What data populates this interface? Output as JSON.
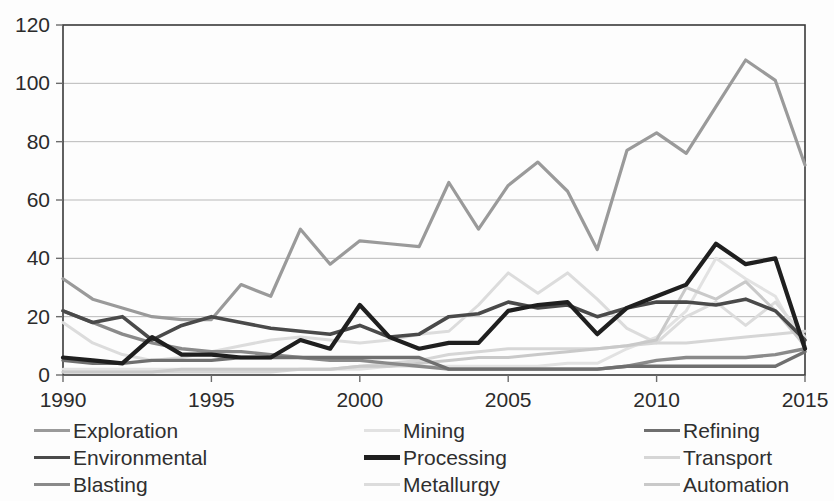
{
  "chart_data": {
    "type": "line",
    "title": "",
    "xlabel": "",
    "ylabel": "",
    "x": [
      1990,
      1991,
      1992,
      1993,
      1994,
      1995,
      1996,
      1997,
      1998,
      1999,
      2000,
      2001,
      2002,
      2003,
      2004,
      2005,
      2006,
      2007,
      2008,
      2009,
      2010,
      2011,
      2012,
      2013,
      2014,
      2015
    ],
    "xlim": [
      1990,
      2015
    ],
    "ylim": [
      0,
      120
    ],
    "xticks": [
      1990,
      1995,
      2000,
      2005,
      2010,
      2015
    ],
    "yticks": [
      0,
      20,
      40,
      60,
      80,
      100,
      120
    ],
    "grid": "horizontal",
    "legend_position": "bottom",
    "legend_columns": 3,
    "series": [
      {
        "name": "Exploration",
        "color": "#9a9a9a",
        "width": 3.2,
        "values": [
          33,
          26,
          23,
          20,
          19,
          19,
          31,
          27,
          50,
          38,
          46,
          45,
          44,
          66,
          50,
          65,
          73,
          63,
          43,
          77,
          83,
          76,
          92,
          108,
          101,
          72
        ]
      },
      {
        "name": "Mining",
        "color": "#e2e2e2",
        "width": 3.0,
        "values": [
          2,
          2,
          2,
          2,
          2,
          2,
          2,
          2,
          2,
          2,
          2,
          3,
          3,
          3,
          3,
          3,
          3,
          4,
          4,
          9,
          13,
          22,
          40,
          33,
          27,
          9
        ]
      },
      {
        "name": "Refining",
        "color": "#6f6f6f",
        "width": 3.4,
        "values": [
          5,
          4,
          4,
          5,
          5,
          5,
          6,
          6,
          6,
          6,
          6,
          6,
          6,
          2,
          2,
          2,
          2,
          2,
          2,
          3,
          3,
          3,
          3,
          3,
          3,
          8
        ]
      },
      {
        "name": "Environmental",
        "color": "#4a4a4a",
        "width": 3.6,
        "values": [
          22,
          18,
          20,
          12,
          17,
          20,
          18,
          16,
          15,
          14,
          17,
          13,
          14,
          20,
          21,
          25,
          23,
          24,
          20,
          23,
          25,
          25,
          24,
          26,
          22,
          12
        ]
      },
      {
        "name": "Processing",
        "color": "#1f1f1f",
        "width": 4.2,
        "values": [
          6,
          5,
          4,
          13,
          7,
          7,
          6,
          6,
          12,
          9,
          24,
          13,
          9,
          11,
          11,
          22,
          24,
          25,
          14,
          23,
          27,
          31,
          45,
          38,
          40,
          9
        ]
      },
      {
        "name": "Transport",
        "color": "#d6d6d6",
        "width": 3.0,
        "values": [
          1,
          1,
          1,
          1,
          1,
          1,
          1,
          1,
          2,
          2,
          3,
          4,
          5,
          7,
          8,
          9,
          9,
          9,
          9,
          10,
          11,
          11,
          12,
          13,
          14,
          15
        ]
      },
      {
        "name": "Blasting",
        "color": "#8a8a8a",
        "width": 3.4,
        "values": [
          22,
          18,
          14,
          11,
          9,
          8,
          8,
          7,
          6,
          5,
          5,
          4,
          3,
          2,
          2,
          2,
          2,
          2,
          2,
          3,
          5,
          6,
          6,
          6,
          7,
          9
        ]
      },
      {
        "name": "Metallurgy",
        "color": "#dcdcdc",
        "width": 3.0,
        "values": [
          18,
          11,
          7,
          5,
          6,
          8,
          10,
          12,
          13,
          12,
          11,
          12,
          14,
          15,
          24,
          35,
          28,
          35,
          26,
          16,
          11,
          20,
          25,
          17,
          25,
          13
        ]
      },
      {
        "name": "Automation",
        "color": "#c9c9c9",
        "width": 3.0,
        "values": [
          1,
          1,
          1,
          1,
          2,
          2,
          2,
          2,
          2,
          2,
          3,
          3,
          4,
          5,
          6,
          6,
          7,
          8,
          9,
          10,
          12,
          30,
          26,
          32,
          22,
          10
        ]
      }
    ]
  },
  "legend": {
    "items": [
      {
        "label": "Exploration",
        "swatch": "legend-line-exploration"
      },
      {
        "label": "Mining",
        "swatch": "legend-line-mining"
      },
      {
        "label": "Refining",
        "swatch": "legend-line-refining"
      },
      {
        "label": "Environmental",
        "swatch": "legend-line-environmental"
      },
      {
        "label": "Processing",
        "swatch": "legend-line-processing"
      },
      {
        "label": "Transport",
        "swatch": "legend-line-transport"
      },
      {
        "label": "Blasting",
        "swatch": "legend-line-blasting"
      },
      {
        "label": "Metallurgy",
        "swatch": "legend-line-metallurgy"
      },
      {
        "label": "Automation",
        "swatch": "legend-line-automation"
      }
    ]
  },
  "axes": {
    "y_labels": [
      "120",
      "100",
      "80",
      "60",
      "40",
      "20",
      "0"
    ],
    "x_labels": [
      "1990",
      "1995",
      "2000",
      "2005",
      "2010",
      "2015"
    ]
  },
  "style": {
    "plot_border_color": "#3a3a3a",
    "gridline_color": "#b9b9b9",
    "background": "#fdfdfd"
  }
}
